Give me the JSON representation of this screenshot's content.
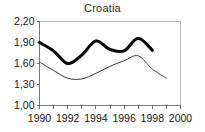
{
  "chart_data": {
    "type": "line",
    "title": "Croatia",
    "xlabel": "",
    "ylabel": "",
    "xlim": [
      1990,
      2000
    ],
    "ylim": [
      1.0,
      2.2
    ],
    "grid": false,
    "legend": "none",
    "x_tick_labels": [
      "1990",
      "1992",
      "1994",
      "1996",
      "1998",
      "2000"
    ],
    "x_tick_values": [
      1990,
      1992,
      1994,
      1996,
      1998,
      2000
    ],
    "x_minor_ticks": [
      1990,
      1991,
      1992,
      1993,
      1994,
      1995,
      1996,
      1997,
      1998,
      1999,
      2000
    ],
    "y_tick_labels": [
      "1,00",
      "1,30",
      "1,60",
      "1,90",
      "2,20"
    ],
    "y_tick_values": [
      1.0,
      1.3,
      1.6,
      1.9,
      2.2
    ],
    "decimal_separator": ",",
    "series": [
      {
        "name": "thick-series",
        "style": "thick-solid",
        "color": "#000000",
        "x": [
          1990,
          1991,
          1992,
          1993,
          1994,
          1995,
          1996,
          1997,
          1998
        ],
        "values": [
          1.9,
          1.78,
          1.6,
          1.72,
          1.92,
          1.8,
          1.78,
          1.96,
          1.79
        ]
      },
      {
        "name": "thin-series",
        "style": "thin-solid",
        "color": "#3a3a3a",
        "x": [
          1990,
          1991,
          1992,
          1993,
          1994,
          1995,
          1996,
          1997,
          1998,
          1999
        ],
        "values": [
          1.62,
          1.5,
          1.39,
          1.38,
          1.46,
          1.56,
          1.64,
          1.71,
          1.52,
          1.39
        ]
      }
    ]
  }
}
